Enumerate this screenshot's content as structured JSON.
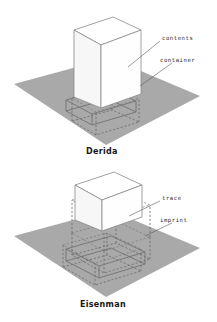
{
  "figure": {
    "background_color": "#ffffff",
    "ground_color": "#a9a9a9",
    "line_color": "#6f6f6f",
    "text_color": "#2b2b2b"
  },
  "panels": [
    {
      "id": "derrida",
      "caption": "Derida",
      "callouts": [
        {
          "id": "contents",
          "label": "contents"
        },
        {
          "id": "container",
          "label": "container"
        }
      ],
      "elements": [
        {
          "name": "ground-plane",
          "style": "filled-gray"
        },
        {
          "name": "solid-volume",
          "style": "white-axonometric-box"
        },
        {
          "name": "recessed-opening",
          "style": "solid-outline"
        },
        {
          "name": "buried-volume",
          "style": "dashed-outline"
        }
      ]
    },
    {
      "id": "eisenman",
      "caption": "Eisenman",
      "callouts": [
        {
          "id": "trace",
          "label": "trace"
        },
        {
          "id": "imprint",
          "label": "imprint"
        }
      ],
      "elements": [
        {
          "name": "ground-plane",
          "style": "filled-gray"
        },
        {
          "name": "floating-cube",
          "style": "white-axonometric-box"
        },
        {
          "name": "imprint-outline",
          "style": "solid-outline"
        },
        {
          "name": "trace-outline-a",
          "style": "dashed-outline"
        },
        {
          "name": "trace-outline-b",
          "style": "dashed-outline"
        },
        {
          "name": "projection-lines",
          "style": "dashed-outline"
        }
      ]
    }
  ]
}
